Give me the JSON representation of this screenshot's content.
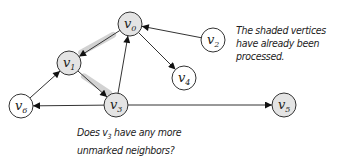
{
  "diagram": {
    "type": "directed-graph",
    "colors": {
      "processed_fill": "#e4e4e4",
      "unprocessed_fill": "#ffffff",
      "stroke": "#333333",
      "highlight": "#c8c8c8"
    },
    "nodes": [
      {
        "id": "v0",
        "label": "v",
        "sub": "0",
        "x": 130,
        "y": 24,
        "processed": true
      },
      {
        "id": "v1",
        "label": "v",
        "sub": "1",
        "x": 69,
        "y": 63,
        "processed": true
      },
      {
        "id": "v2",
        "label": "v",
        "sub": "2",
        "x": 213,
        "y": 40,
        "processed": false
      },
      {
        "id": "v3",
        "label": "v",
        "sub": "3",
        "x": 116,
        "y": 105,
        "processed": true
      },
      {
        "id": "v4",
        "label": "v",
        "sub": "4",
        "x": 184,
        "y": 78,
        "processed": false
      },
      {
        "id": "v5",
        "label": "v",
        "sub": "5",
        "x": 284,
        "y": 105,
        "processed": true
      },
      {
        "id": "v6",
        "label": "v",
        "sub": "6",
        "x": 21,
        "y": 106,
        "processed": false
      }
    ],
    "edges": [
      {
        "from": "v0",
        "to": "v1",
        "highlighted": true
      },
      {
        "from": "v1",
        "to": "v3",
        "highlighted": true
      },
      {
        "from": "v2",
        "to": "v0",
        "highlighted": false
      },
      {
        "from": "v0",
        "to": "v4",
        "highlighted": false
      },
      {
        "from": "v3",
        "to": "v0",
        "highlighted": false
      },
      {
        "from": "v6",
        "to": "v1",
        "highlighted": false
      },
      {
        "from": "v3",
        "to": "v6",
        "highlighted": false
      },
      {
        "from": "v3",
        "to": "v5",
        "highlighted": false
      }
    ]
  },
  "annotations": {
    "processed_note": [
      "The shaded vertices",
      "have already been",
      "processed."
    ],
    "question_line1_prefix": "Does v",
    "question_line1_sub": "3",
    "question_line1_suffix": " have any more",
    "question_line2": "unmarked neighbors?"
  }
}
